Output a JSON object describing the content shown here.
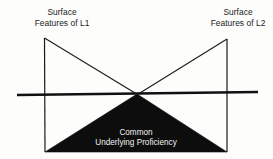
{
  "figure": {
    "background_color": "#fdfdfc",
    "ink_color": "#1a1a1a",
    "fill_color": "#0d0d0d",
    "reverse_text_color": "#f2f2f2"
  },
  "labels": {
    "left_peak": {
      "line1": "Surface",
      "line2": "Features of L1"
    },
    "right_peak": {
      "line1": "Surface",
      "line2": "Features of L2"
    },
    "submerged": {
      "line1": "Common",
      "line2": "Underlying Proficiency"
    }
  },
  "geometry": {
    "waterline": {
      "x1": 17,
      "y1": 95,
      "x2": 258,
      "y2": 92,
      "stroke_width": 2.4
    },
    "left_peak_point": {
      "x": 44,
      "y": 38
    },
    "right_peak_point": {
      "x": 227,
      "y": 39
    },
    "crossing_point": {
      "x": 137,
      "y": 94
    },
    "base_left": {
      "x": 45,
      "y": 152
    },
    "base_right": {
      "x": 227,
      "y": 152
    },
    "outline_stroke_width": 1.1,
    "submerged_triangle": "M45,152 L137,94 L227,152 Z"
  }
}
